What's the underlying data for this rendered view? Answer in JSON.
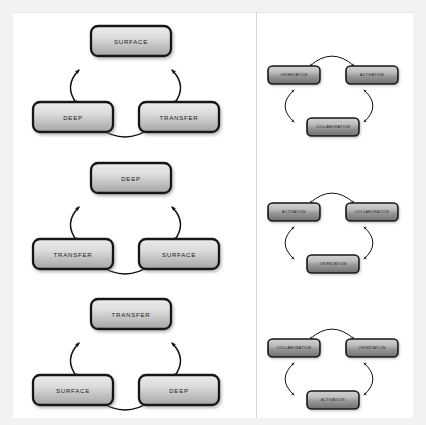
{
  "figure": {
    "background_color": "#f2f2f2",
    "panel_color": "#ffffff",
    "divider_color": "#d8d8d8",
    "box_border_color": "#121212",
    "box_fill_top": "#e8e8e8",
    "box_fill_bottom": "#a8a8a8",
    "box_fill_top_dark": "#c9c9c9",
    "box_fill_bottom_dark": "#6f6f6f",
    "arrow_color": "#111111",
    "text_color": "#1c1c1c"
  },
  "diagrams": [
    {
      "id": "left-cycle-1",
      "column": "left",
      "row": "a",
      "scale": "large",
      "nodes": {
        "top": "SURFACE",
        "left": "DEEP",
        "right": "TRANSFER"
      },
      "arrows": [
        {
          "from": "top",
          "to": "left",
          "style": "double-headed-curve"
        },
        {
          "from": "top",
          "to": "right",
          "style": "double-headed-curve"
        },
        {
          "from": "left",
          "to": "right",
          "style": "double-headed-curve"
        }
      ]
    },
    {
      "id": "right-cycle-1",
      "column": "right",
      "row": "a",
      "scale": "small",
      "nodes": {
        "top": "COLLABORATION",
        "left": "ORIENTATION",
        "right": "ACTIVATION"
      },
      "arrows": [
        {
          "from": "left",
          "to": "right",
          "style": "double-headed-curve"
        },
        {
          "from": "right",
          "to": "top",
          "style": "double-headed-curve"
        },
        {
          "from": "left",
          "to": "top",
          "style": "double-headed-curve"
        }
      ]
    },
    {
      "id": "left-cycle-2",
      "column": "left",
      "row": "b",
      "scale": "large",
      "nodes": {
        "top": "DEEP",
        "left": "TRANSFER",
        "right": "SURFACE"
      },
      "arrows": [
        {
          "from": "top",
          "to": "left",
          "style": "double-headed-curve"
        },
        {
          "from": "top",
          "to": "right",
          "style": "double-headed-curve"
        },
        {
          "from": "left",
          "to": "right",
          "style": "double-headed-curve"
        }
      ]
    },
    {
      "id": "right-cycle-2",
      "column": "right",
      "row": "b",
      "scale": "small",
      "nodes": {
        "top": "ORIENTATION",
        "left": "ACTIVATION",
        "right": "COLLABORATION"
      },
      "arrows": [
        {
          "from": "left",
          "to": "right",
          "style": "double-headed-curve"
        },
        {
          "from": "right",
          "to": "top",
          "style": "double-headed-curve"
        },
        {
          "from": "left",
          "to": "top",
          "style": "double-headed-curve"
        }
      ]
    },
    {
      "id": "left-cycle-3",
      "column": "left",
      "row": "c",
      "scale": "large",
      "nodes": {
        "top": "TRANSFER",
        "left": "SURFACE",
        "right": "DEEP"
      },
      "arrows": [
        {
          "from": "top",
          "to": "left",
          "style": "double-headed-curve"
        },
        {
          "from": "top",
          "to": "right",
          "style": "double-headed-curve"
        },
        {
          "from": "left",
          "to": "right",
          "style": "double-headed-curve"
        }
      ]
    },
    {
      "id": "right-cycle-3",
      "column": "right",
      "row": "c",
      "scale": "small",
      "nodes": {
        "top": "ACTIVATION",
        "left": "COLLABORATION",
        "right": "ORIENTATION"
      },
      "arrows": [
        {
          "from": "left",
          "to": "right",
          "style": "double-headed-curve"
        },
        {
          "from": "right",
          "to": "top",
          "style": "double-headed-curve"
        },
        {
          "from": "left",
          "to": "top",
          "style": "double-headed-curve"
        }
      ]
    }
  ]
}
